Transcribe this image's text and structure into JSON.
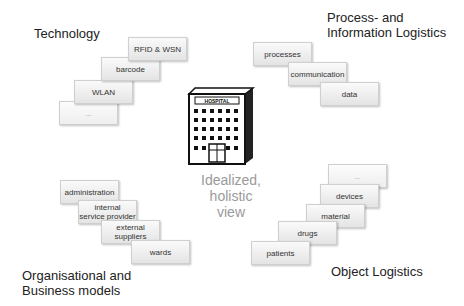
{
  "quadrants": {
    "technology": {
      "title": "Technology",
      "items": [
        "RFID & WSN",
        "barcode",
        "WLAN",
        "..."
      ]
    },
    "process": {
      "title": "Process- and\nInformation Logistics",
      "items": [
        "processes",
        "communication",
        "data"
      ]
    },
    "organisation": {
      "title": "Organisational and\nBusiness models",
      "items": [
        "administration",
        "internal\nservice provider",
        "external\nsuppliers",
        "wards"
      ]
    },
    "object": {
      "title": "Object Logistics",
      "items": [
        "...",
        "devices",
        "material",
        "drugs",
        "patients"
      ]
    }
  },
  "center": {
    "sign": "HOSPITAL",
    "label": "Idealized,\nholistic\nview"
  }
}
